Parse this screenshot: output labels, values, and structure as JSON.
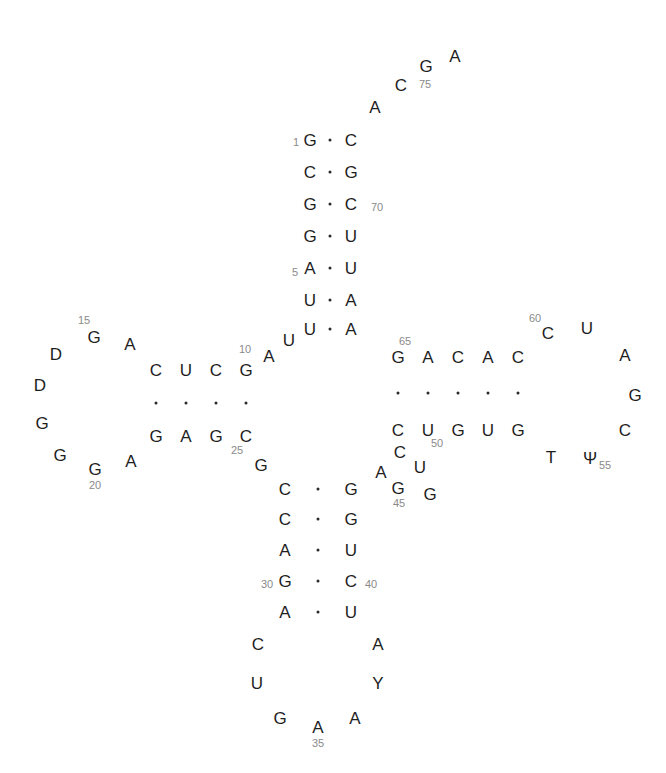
{
  "nucleotides": [
    {
      "id": "n1",
      "base": "G"
    },
    {
      "id": "n2",
      "base": "C"
    },
    {
      "id": "n3",
      "base": "G"
    },
    {
      "id": "n4",
      "base": "G"
    },
    {
      "id": "n5",
      "base": "A"
    },
    {
      "id": "n6",
      "base": "U"
    },
    {
      "id": "n7",
      "base": "U"
    },
    {
      "id": "n8",
      "base": "U"
    },
    {
      "id": "n9",
      "base": "A"
    },
    {
      "id": "n10",
      "base": "G"
    },
    {
      "id": "n11",
      "base": "C"
    },
    {
      "id": "n12",
      "base": "U"
    },
    {
      "id": "n13",
      "base": "C"
    },
    {
      "id": "n14",
      "base": "A"
    },
    {
      "id": "n15",
      "base": "G"
    },
    {
      "id": "n16",
      "base": "D"
    },
    {
      "id": "n17",
      "base": "D"
    },
    {
      "id": "n18",
      "base": "G"
    },
    {
      "id": "n19",
      "base": "G"
    },
    {
      "id": "n20",
      "base": "G"
    },
    {
      "id": "n21",
      "base": "A"
    },
    {
      "id": "n22",
      "base": "G"
    },
    {
      "id": "n23",
      "base": "A"
    },
    {
      "id": "n24",
      "base": "G"
    },
    {
      "id": "n25",
      "base": "C"
    },
    {
      "id": "n26",
      "base": "G"
    },
    {
      "id": "n27",
      "base": "C"
    },
    {
      "id": "n28",
      "base": "C"
    },
    {
      "id": "n29",
      "base": "A"
    },
    {
      "id": "n30",
      "base": "G"
    },
    {
      "id": "n31",
      "base": "A"
    },
    {
      "id": "n32",
      "base": "C"
    },
    {
      "id": "n33",
      "base": "U"
    },
    {
      "id": "n34",
      "base": "G"
    },
    {
      "id": "n35",
      "base": "A"
    },
    {
      "id": "n36",
      "base": "A"
    },
    {
      "id": "n37",
      "base": "Y"
    },
    {
      "id": "n38",
      "base": "A"
    },
    {
      "id": "n39",
      "base": "U"
    },
    {
      "id": "n40",
      "base": "C"
    },
    {
      "id": "n41",
      "base": "U"
    },
    {
      "id": "n42",
      "base": "G"
    },
    {
      "id": "n43",
      "base": "G"
    },
    {
      "id": "n44",
      "base": "A"
    },
    {
      "id": "n45",
      "base": "G"
    },
    {
      "id": "n46",
      "base": "G"
    },
    {
      "id": "n47",
      "base": "U"
    },
    {
      "id": "n48",
      "base": "C"
    },
    {
      "id": "n49",
      "base": "C"
    },
    {
      "id": "n50",
      "base": "U"
    },
    {
      "id": "n51",
      "base": "G"
    },
    {
      "id": "n52",
      "base": "U"
    },
    {
      "id": "n53",
      "base": "G"
    },
    {
      "id": "n54",
      "base": "T"
    },
    {
      "id": "n55",
      "base": "Ψ"
    },
    {
      "id": "n56",
      "base": "C"
    },
    {
      "id": "n57",
      "base": "G"
    },
    {
      "id": "n58",
      "base": "A"
    },
    {
      "id": "n59",
      "base": "U"
    },
    {
      "id": "n60",
      "base": "C"
    },
    {
      "id": "n61",
      "base": "C"
    },
    {
      "id": "n62",
      "base": "A"
    },
    {
      "id": "n63",
      "base": "C"
    },
    {
      "id": "n64",
      "base": "A"
    },
    {
      "id": "n65",
      "base": "G"
    },
    {
      "id": "n66",
      "base": "A"
    },
    {
      "id": "n67",
      "base": "A"
    },
    {
      "id": "n68",
      "base": "U"
    },
    {
      "id": "n69",
      "base": "U"
    },
    {
      "id": "n70",
      "base": "C"
    },
    {
      "id": "n71",
      "base": "G"
    },
    {
      "id": "n72",
      "base": "C"
    },
    {
      "id": "n73",
      "base": "A"
    },
    {
      "id": "n74",
      "base": "C"
    },
    {
      "id": "n75",
      "base": "G"
    },
    {
      "id": "n76",
      "base": "A"
    }
  ],
  "position_labels": [
    "1",
    "5",
    "10",
    "15",
    "20",
    "25",
    "30",
    "35",
    "40",
    "45",
    "50",
    "55",
    "60",
    "65",
    "70",
    "75"
  ],
  "base_pairs": [
    [
      "1",
      "72"
    ],
    [
      "2",
      "71"
    ],
    [
      "3",
      "70"
    ],
    [
      "4",
      "69"
    ],
    [
      "5",
      "68"
    ],
    [
      "6",
      "67"
    ],
    [
      "7",
      "66"
    ],
    [
      "10",
      "25"
    ],
    [
      "11",
      "24"
    ],
    [
      "12",
      "23"
    ],
    [
      "13",
      "22"
    ],
    [
      "27",
      "43"
    ],
    [
      "28",
      "42"
    ],
    [
      "29",
      "41"
    ],
    [
      "30",
      "40"
    ],
    [
      "31",
      "39"
    ],
    [
      "49",
      "65"
    ],
    [
      "50",
      "64"
    ],
    [
      "51",
      "63"
    ],
    [
      "52",
      "62"
    ],
    [
      "53",
      "61"
    ]
  ],
  "colors": {
    "base": "#1e1e1e",
    "label": "#8a8a8a",
    "pair_dot": "#2a2a2a"
  }
}
